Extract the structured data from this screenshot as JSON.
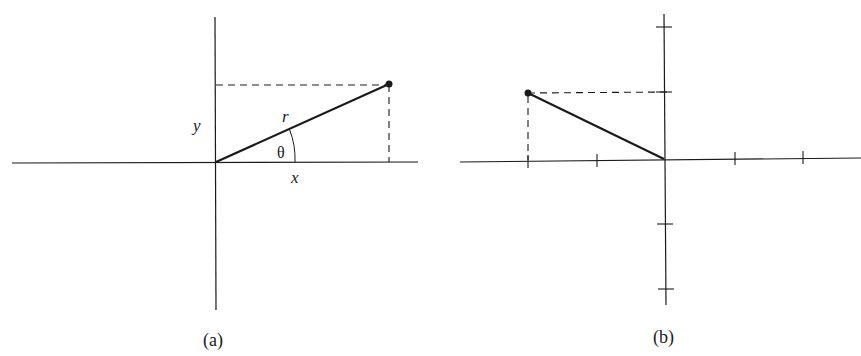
{
  "figure": {
    "panels": [
      {
        "id": "a",
        "caption": "(a)",
        "labels": {
          "y": "y",
          "r": "r",
          "theta": "θ",
          "x": "x"
        },
        "description": "Point in first quadrant with radius r at angle θ from positive x-axis; projections x and y shown dashed"
      },
      {
        "id": "b",
        "caption": "(b)",
        "axis_ticks": {
          "x": [
            -2,
            -1,
            1,
            2
          ],
          "y": [
            2,
            1,
            -1,
            -2
          ]
        },
        "point": {
          "x": -2,
          "y": 1
        },
        "description": "Point at (-2, 1) connected to origin, with dashed projections to axes"
      }
    ]
  },
  "colors": {
    "ink": "#1a1a1a",
    "background": "#ffffff"
  }
}
